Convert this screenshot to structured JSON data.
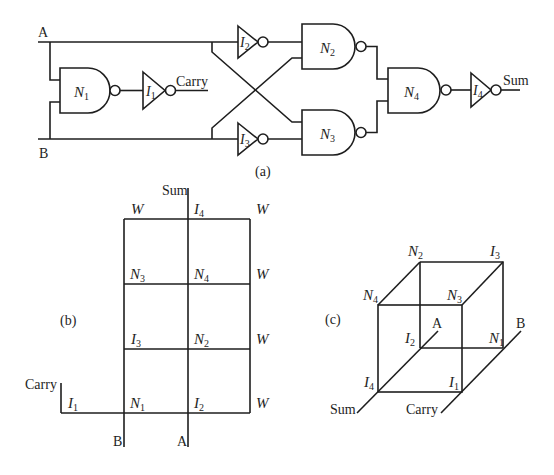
{
  "figure": {
    "background_color": "#ffffff",
    "ink_color": "#1e1e1e",
    "panels": {
      "a": {
        "caption": "(a)",
        "inputs": {
          "a_label": "A",
          "b_label": "B"
        },
        "outputs": {
          "carry_label": "Carry",
          "sum_label": "Sum"
        },
        "gates": {
          "n1": {
            "letter": "N",
            "sub": "1",
            "type": "NAND"
          },
          "n2": {
            "letter": "N",
            "sub": "2",
            "type": "NAND"
          },
          "n3": {
            "letter": "N",
            "sub": "3",
            "type": "NAND"
          },
          "n4": {
            "letter": "N",
            "sub": "4",
            "type": "NAND"
          },
          "i1": {
            "letter": "I",
            "sub": "1",
            "type": "NOT"
          },
          "i2": {
            "letter": "I",
            "sub": "2",
            "type": "NOT"
          },
          "i3": {
            "letter": "I",
            "sub": "3",
            "type": "NOT"
          },
          "i4": {
            "letter": "I",
            "sub": "4",
            "type": "NOT"
          }
        }
      },
      "b": {
        "caption": "(b)",
        "sum_label": "Sum",
        "carry_label": "Carry",
        "b_label": "B",
        "a_label": "A",
        "cells": {
          "w_top_left": {
            "letter": "W",
            "sub": ""
          },
          "i4": {
            "letter": "I",
            "sub": "4"
          },
          "w_top_right": {
            "letter": "W",
            "sub": ""
          },
          "n3": {
            "letter": "N",
            "sub": "3"
          },
          "n4": {
            "letter": "N",
            "sub": "4"
          },
          "w_row2": {
            "letter": "W",
            "sub": ""
          },
          "i3": {
            "letter": "I",
            "sub": "3"
          },
          "n2": {
            "letter": "N",
            "sub": "2"
          },
          "w_row3": {
            "letter": "W",
            "sub": ""
          },
          "i1": {
            "letter": "I",
            "sub": "1"
          },
          "n1": {
            "letter": "N",
            "sub": "1"
          },
          "i2": {
            "letter": "I",
            "sub": "2"
          },
          "w_row4": {
            "letter": "W",
            "sub": ""
          }
        }
      },
      "c": {
        "caption": "(c)",
        "a_label": "A",
        "b_label": "B",
        "sum_label": "Sum",
        "carry_label": "Carry",
        "vertices": {
          "n2": {
            "letter": "N",
            "sub": "2"
          },
          "i3": {
            "letter": "I",
            "sub": "3"
          },
          "n4": {
            "letter": "N",
            "sub": "4"
          },
          "n3": {
            "letter": "N",
            "sub": "3"
          },
          "i2": {
            "letter": "I",
            "sub": "2"
          },
          "n1": {
            "letter": "N",
            "sub": "1"
          },
          "i4": {
            "letter": "I",
            "sub": "4"
          },
          "i1": {
            "letter": "I",
            "sub": "1"
          }
        }
      }
    }
  }
}
